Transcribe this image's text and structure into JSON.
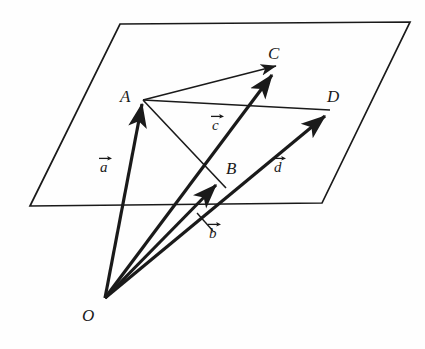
{
  "figure": {
    "background_color": "#fefefe",
    "ink_color": "#1a1a1a",
    "plane_stroke_width": 1.6,
    "vector_stroke_width": 3.2,
    "thin_stroke_width": 1.5
  },
  "points": {
    "O": {
      "label": "O",
      "x": 105,
      "y": 298,
      "label_x": 82,
      "label_y": 307
    },
    "A": {
      "label": "A",
      "x": 143,
      "y": 100,
      "label_x": 120,
      "label_y": 88
    },
    "B": {
      "label": "B",
      "x": 219,
      "y": 180,
      "label_x": 226,
      "label_y": 160
    },
    "C": {
      "label": "C",
      "x": 275,
      "y": 70,
      "label_x": 268,
      "label_y": 45
    },
    "D": {
      "label": "D",
      "x": 328,
      "y": 112,
      "label_x": 327,
      "label_y": 88
    }
  },
  "vectors": [
    {
      "name": "a",
      "label": "a",
      "from": "O",
      "to": "A",
      "label_x": 100,
      "label_y": 160
    },
    {
      "name": "b",
      "label": "b",
      "from": "O",
      "to": "B",
      "label_x": 209,
      "label_y": 226
    },
    {
      "name": "c",
      "label": "c",
      "from": "O",
      "to": "C",
      "label_x": 212,
      "label_y": 118
    },
    {
      "name": "d",
      "label": "d",
      "from": "O",
      "to": "D",
      "label_x": 274,
      "label_y": 160
    }
  ],
  "plane": {
    "name": "plane-parallelogram",
    "corners": [
      {
        "x": 120,
        "y": 24
      },
      {
        "x": 410,
        "y": 22
      },
      {
        "x": 322,
        "y": 203
      },
      {
        "x": 30,
        "y": 206
      }
    ]
  },
  "thin_edges": [
    {
      "name": "edge-A-C",
      "from": "A",
      "to": "C"
    },
    {
      "name": "edge-A-D",
      "from": "A",
      "to": "D"
    },
    {
      "name": "edge-A-B",
      "from": "A",
      "to": "B"
    }
  ],
  "b_leader": {
    "name": "b-leader-line",
    "x1": 197,
    "y1": 213,
    "x2": 213,
    "y2": 231
  }
}
